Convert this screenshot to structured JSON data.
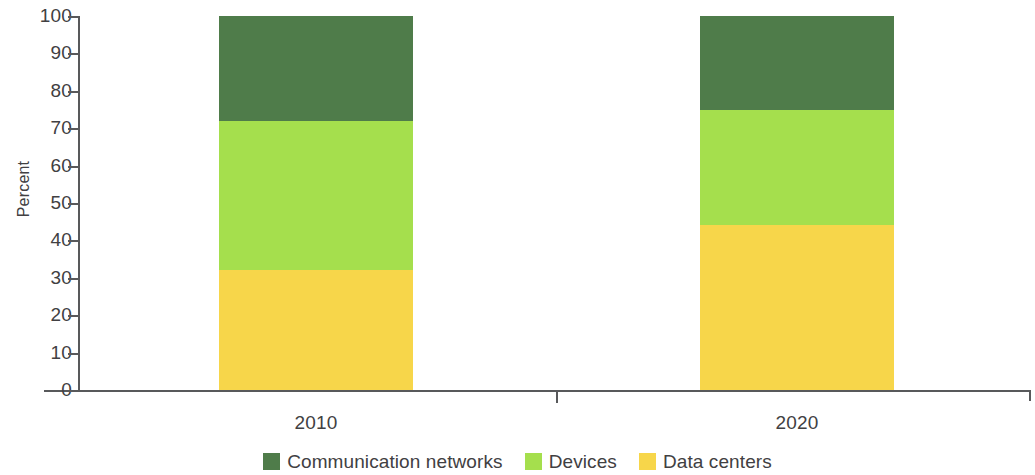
{
  "chart_data": {
    "type": "bar",
    "subtype": "stacked-100-percent",
    "title": "",
    "xlabel": "",
    "ylabel": "Percent",
    "ylim": [
      0,
      100
    ],
    "yticks": [
      0,
      10,
      20,
      30,
      40,
      50,
      60,
      70,
      80,
      90,
      100
    ],
    "grid": false,
    "legend_position": "bottom-center",
    "categories": [
      "2010",
      "2020"
    ],
    "stack_order_bottom_to_top": [
      "Data centers",
      "Devices",
      "Communication networks"
    ],
    "series": [
      {
        "name": "Communication networks",
        "color": "#4f7c4a",
        "values": [
          28,
          25
        ]
      },
      {
        "name": "Devices",
        "color": "#a5df4d",
        "values": [
          40,
          31
        ]
      },
      {
        "name": "Data centers",
        "color": "#f7d64a",
        "values": [
          32,
          44
        ]
      }
    ],
    "cumulative_boundaries": {
      "2010": [
        0,
        32,
        72,
        100
      ],
      "2020": [
        0,
        44,
        75,
        100
      ]
    }
  },
  "axes": {
    "y_title": "Percent",
    "y_tick_labels": [
      "100",
      "90",
      "80",
      "70",
      "60",
      "50",
      "40",
      "30",
      "20",
      "10",
      "0"
    ],
    "x_tick_labels": [
      "2010",
      "2020"
    ]
  },
  "legend": {
    "items": [
      {
        "label": "Communication networks",
        "color": "#4f7c4a"
      },
      {
        "label": "Devices",
        "color": "#a5df4d"
      },
      {
        "label": "Data centers",
        "color": "#f7d64a"
      }
    ]
  },
  "colors": {
    "communication_networks": "#4f7c4a",
    "devices": "#a5df4d",
    "data_centers": "#f7d64a",
    "axis": "#58595b",
    "text": "#414042",
    "background": "#ffffff"
  }
}
